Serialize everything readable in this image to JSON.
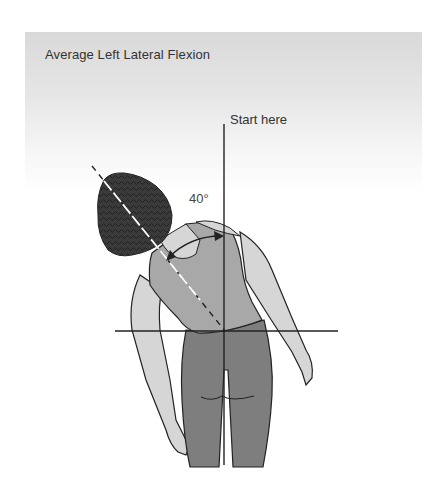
{
  "figure": {
    "title": "Average Left Lateral Flexion",
    "start_label": "Start here",
    "angle_label": "40°",
    "angle_degrees": 40,
    "colors": {
      "panel_top": "#d9d9d9",
      "hair": "#3a3a3a",
      "top_garment": "#a8a8a8",
      "skin": "#d6d6d6",
      "pants": "#7e7e7e",
      "line": "#222222"
    }
  }
}
